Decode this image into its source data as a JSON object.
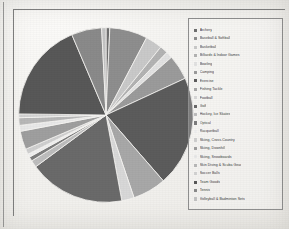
{
  "chart_data": {
    "type": "pie",
    "title": "",
    "legend_position": "right",
    "categories": [
      "Archery",
      "Baseball & Softball",
      "Basketball",
      "Billiards & Indoor Games",
      "Bowling",
      "Camping",
      "Exercise",
      "Fishing Tackle",
      "Football",
      "Golf",
      "Hockey, Ice Skates",
      "Optical",
      "Racquetball",
      "Skiing, Cross-Country",
      "Skiing, Downhill",
      "Skiing, Snowboards",
      "Skin Diving & Scuba Gear",
      "Soccer Balls",
      "Team Goods",
      "Tennis",
      "Volleyball & Badminton Sets"
    ],
    "values": [
      0.7,
      7.0,
      3.1,
      1.5,
      1.2,
      4.6,
      20.5,
      6.2,
      2.3,
      17.8,
      1.3,
      0.8,
      0.6,
      1.0,
      3.4,
      1.1,
      1.4,
      0.7,
      18.4,
      5.6,
      0.8
    ],
    "colors": [
      "#6f6f6f",
      "#8e8e8e",
      "#c9c9c9",
      "#b3b3b3",
      "#e2e2e2",
      "#9b9b9b",
      "#5c5c5c",
      "#a8a8a8",
      "#d8d8d8",
      "#6a6a6a",
      "#bdbdbd",
      "#7d7d7d",
      "#efefef",
      "#cfcfcf",
      "#9f9f9f",
      "#e8e8e8",
      "#b8b8b8",
      "#d2d2d2",
      "#585858",
      "#8a8a8a",
      "#c3c3c3"
    ],
    "startangle": 90,
    "counterclock": false
  },
  "legend": {
    "marker_shape": "square"
  }
}
